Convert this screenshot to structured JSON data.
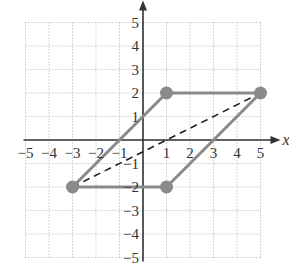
{
  "chart_data": {
    "type": "scatter",
    "title": "",
    "xlabel": "x",
    "ylabel": "",
    "xlim": [
      -5,
      5
    ],
    "ylim": [
      -5,
      5
    ],
    "grid": true,
    "x_ticks": [
      "-5",
      "-4",
      "-3",
      "-2",
      "-1",
      "1",
      "2",
      "3",
      "4",
      "5"
    ],
    "y_ticks": [
      "5",
      "4",
      "3",
      "2",
      "1",
      "-1",
      "-2",
      "-3",
      "-4",
      "-5"
    ],
    "points": [
      {
        "x": 1,
        "y": 2
      },
      {
        "x": 5,
        "y": 2
      },
      {
        "x": 1,
        "y": -2
      },
      {
        "x": -3,
        "y": -2
      }
    ],
    "series": [
      {
        "name": "parallelogram",
        "style": "solid",
        "color": "#8a8a8a",
        "x": [
          -3,
          1,
          5,
          1,
          -3
        ],
        "y": [
          -2,
          2,
          2,
          -2,
          -2
        ]
      },
      {
        "name": "diagonal",
        "style": "dashed",
        "color": "#222222",
        "x": [
          -3,
          5
        ],
        "y": [
          -2,
          2
        ]
      }
    ],
    "colors": {
      "shape": "#8a8a8a",
      "axes": "#333333",
      "grid": "#b0b0b0",
      "dashed": "#222222"
    }
  }
}
